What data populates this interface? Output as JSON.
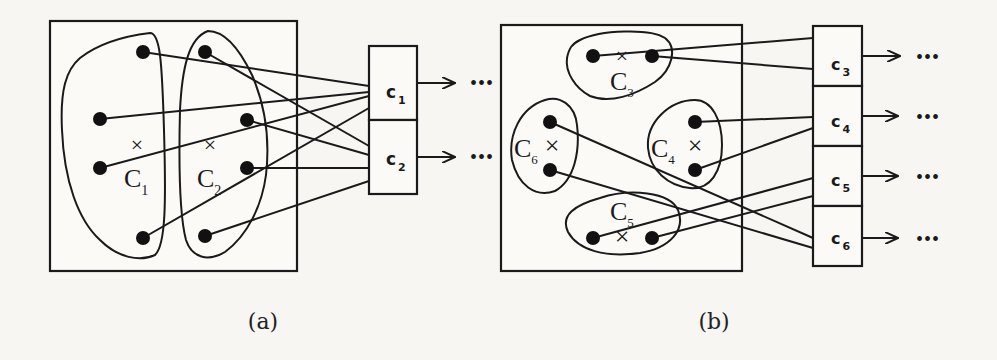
{
  "figure": {
    "panel_a": {
      "caption": "(a)",
      "clusters": [
        {
          "name": "C",
          "sub": "1"
        },
        {
          "name": "C",
          "sub": "2"
        }
      ],
      "buckets": [
        {
          "name": "c",
          "sub": "1"
        },
        {
          "name": "c",
          "sub": "2"
        }
      ],
      "ellipsis": "•••"
    },
    "panel_b": {
      "caption": "(b)",
      "clusters": [
        {
          "name": "C",
          "sub": "3"
        },
        {
          "name": "C",
          "sub": "4"
        },
        {
          "name": "C",
          "sub": "5"
        },
        {
          "name": "C",
          "sub": "6"
        }
      ],
      "buckets": [
        {
          "name": "c",
          "sub": "3"
        },
        {
          "name": "c",
          "sub": "4"
        },
        {
          "name": "c",
          "sub": "5"
        },
        {
          "name": "c",
          "sub": "6"
        }
      ],
      "ellipsis": "•••"
    },
    "center_marker": "×",
    "colors": {
      "ink": "#1a1a1a",
      "paper": "#f7f6f3"
    }
  }
}
